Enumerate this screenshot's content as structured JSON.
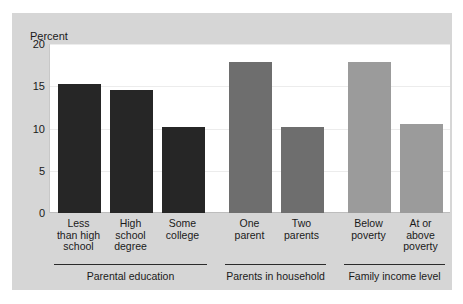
{
  "chart_data": {
    "type": "bar",
    "title": "",
    "subtitle": "",
    "xlabel": "",
    "ylabel": "Percent",
    "ylim": [
      0,
      20
    ],
    "yticks": [
      0,
      5,
      10,
      15,
      20
    ],
    "ytick_labels": [
      "0",
      "5",
      "10",
      "15",
      "20"
    ],
    "grid": true,
    "legend": "none",
    "categories": [
      "Less than high school",
      "High school degree",
      "Some college",
      "One parent",
      "Two parents",
      "Below poverty",
      "At or above poverty"
    ],
    "values": [
      15.3,
      14.6,
      10.2,
      17.9,
      10.2,
      17.9,
      10.5
    ],
    "groups": [
      {
        "caption": "Parental education",
        "color": "#262626",
        "bars": [
          {
            "label_lines": [
              "Less",
              "than high",
              "school"
            ],
            "value": 15.3
          },
          {
            "label_lines": [
              "High",
              "school",
              "degree"
            ],
            "value": 14.6
          },
          {
            "label_lines": [
              "Some",
              "college"
            ],
            "value": 10.2
          }
        ]
      },
      {
        "caption": "Parents in household",
        "color": "#6e6e6e",
        "bars": [
          {
            "label_lines": [
              "One",
              "parent"
            ],
            "value": 17.9
          },
          {
            "label_lines": [
              "Two",
              "parents"
            ],
            "value": 10.2
          }
        ]
      },
      {
        "caption": "Family income level",
        "color": "#9b9b9b",
        "bars": [
          {
            "label_lines": [
              "Below",
              "poverty"
            ],
            "value": 17.9
          },
          {
            "label_lines": [
              "At or",
              "above",
              "poverty"
            ],
            "value": 10.5
          }
        ]
      }
    ]
  },
  "colors": {
    "figure_background": "#ffffff",
    "panel_background": "#d6d6d6",
    "plot_background": "#ffffff",
    "gridline": "#ececec",
    "axis": "#bdbdbd",
    "text": "#1a1a1a",
    "group_rule": "#2b2b2b"
  }
}
